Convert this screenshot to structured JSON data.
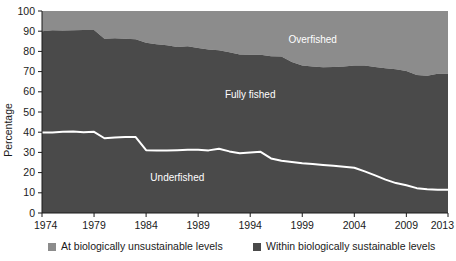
{
  "chart_data": {
    "type": "area",
    "title": "",
    "subtitle": "",
    "xlabel": "",
    "ylabel": "Percentage",
    "xlim": [
      1974,
      2013
    ],
    "ylim": [
      0,
      100
    ],
    "grid": false,
    "stacked": true,
    "legend_position": "bottom",
    "x": [
      1974,
      1975,
      1976,
      1977,
      1978,
      1979,
      1980,
      1981,
      1982,
      1983,
      1984,
      1985,
      1986,
      1987,
      1988,
      1989,
      1990,
      1991,
      1992,
      1993,
      1994,
      1995,
      1996,
      1997,
      1998,
      1999,
      2000,
      2001,
      2002,
      2003,
      2004,
      2005,
      2006,
      2007,
      2008,
      2009,
      2010,
      2011,
      2012,
      2013
    ],
    "tick_labels_x": [
      "1974",
      "1979",
      "1984",
      "1989",
      "1994",
      "1999",
      "2004",
      "2009",
      "2013"
    ],
    "tick_values_x": [
      1974,
      1979,
      1984,
      1989,
      1994,
      1999,
      2004,
      2009,
      2013
    ],
    "tick_labels_y": [
      "0",
      "10",
      "20",
      "30",
      "40",
      "50",
      "60",
      "70",
      "80",
      "90",
      "100"
    ],
    "tick_values_y": [
      0,
      10,
      20,
      30,
      40,
      50,
      60,
      70,
      80,
      90,
      100
    ],
    "series": [
      {
        "name": "Underfished",
        "label": "Underfished",
        "color": "#4a4a4a",
        "legend": "Within biologically sustainable levels",
        "values": [
          39.8,
          39.9,
          40.2,
          40.4,
          40.0,
          40.2,
          37.0,
          37.4,
          37.6,
          37.6,
          31.1,
          31.0,
          31.0,
          31.1,
          31.3,
          31.3,
          31.0,
          31.8,
          30.5,
          29.6,
          30.0,
          30.3,
          27.0,
          25.9,
          25.2,
          24.6,
          24.3,
          23.8,
          23.4,
          22.9,
          22.4,
          20.6,
          18.6,
          16.5,
          14.8,
          13.7,
          12.3,
          11.8,
          11.5,
          11.5
        ]
      },
      {
        "name": "Fully fished",
        "label": "Fully fished",
        "color": "#4a4a4a",
        "legend": "Within biologically sustainable levels",
        "values": [
          50.2,
          50.6,
          50.1,
          50.1,
          50.6,
          50.4,
          49.3,
          49.1,
          48.7,
          48.4,
          53.2,
          52.5,
          52.1,
          51.1,
          51.3,
          50.4,
          50.0,
          48.8,
          49.1,
          48.9,
          48.4,
          48.0,
          50.6,
          51.6,
          49.6,
          48.4,
          48.2,
          48.4,
          48.9,
          49.6,
          50.6,
          52.4,
          53.7,
          55.1,
          56.4,
          56.6,
          56.0,
          56.1,
          57.4,
          57.4
        ]
      },
      {
        "name": "Overfished",
        "label": "Overfished",
        "color": "#8c8c8c",
        "legend": "At biologically unsustainable levels",
        "values": [
          10.0,
          9.5,
          9.7,
          9.5,
          9.4,
          9.4,
          13.7,
          13.5,
          13.7,
          14.0,
          15.7,
          16.5,
          16.9,
          17.8,
          17.4,
          18.3,
          19.0,
          19.4,
          20.4,
          21.5,
          21.6,
          21.7,
          22.4,
          22.5,
          25.2,
          27.0,
          27.5,
          27.8,
          27.7,
          27.5,
          27.0,
          27.0,
          27.7,
          28.4,
          28.8,
          29.7,
          31.7,
          32.1,
          31.1,
          31.1
        ]
      }
    ],
    "upper_boundary_note": "Top of the dark (sustainable) band = 100 minus Overfished",
    "annotations": [
      {
        "text": "Overfished",
        "x": 2000,
        "y": 84,
        "color": "#ffffff"
      },
      {
        "text": "Fully fished",
        "x": 1994,
        "y": 57,
        "color": "#ffffff"
      },
      {
        "text": "Underfished",
        "x": 1987,
        "y": 16,
        "color": "#ffffff"
      }
    ]
  },
  "axis": {
    "y_title": "Percentage"
  },
  "legend": {
    "items": [
      {
        "label": "At biologically unsustainable levels",
        "color": "#8c8c8c"
      },
      {
        "label": "Within biologically sustainable levels",
        "color": "#4a4a4a"
      }
    ]
  },
  "colors": {
    "unsustainable": "#8c8c8c",
    "sustainable": "#4a4a4a",
    "line": "#ffffff",
    "axis": "#1a1a1a",
    "background": "#ffffff"
  }
}
